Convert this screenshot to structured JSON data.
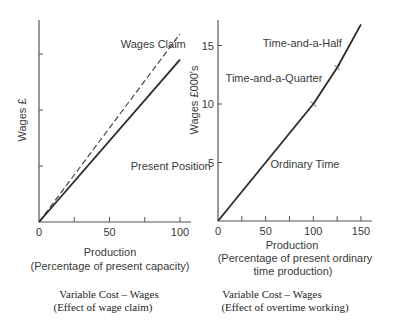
{
  "chart_data": [
    {
      "type": "line",
      "id": "left",
      "xlabel": "Production",
      "xlabel_sub": "(Percentage of present capacity)",
      "ylabel": "Wages £",
      "caption": [
        "Variable Cost – Wages",
        "(Effect of wage claim)"
      ],
      "xlim": [
        0,
        108
      ],
      "ylim": [
        0,
        4.3
      ],
      "x_ticks": [
        0,
        25,
        50,
        75,
        100
      ],
      "x_tick_labels": [
        "0",
        "50",
        "100"
      ],
      "x_tick_label_values": [
        0,
        50,
        100
      ],
      "y_ticks": [
        1,
        2,
        3
      ],
      "y_tick_labels": [],
      "grid": false,
      "series": [
        {
          "name": "Wages Claim",
          "style": "dashed",
          "x": [
            0,
            100
          ],
          "y": [
            0,
            3.36
          ]
        },
        {
          "name": "Present Position",
          "style": "solid",
          "x": [
            0,
            100
          ],
          "y": [
            0,
            2.9
          ]
        }
      ],
      "annotations": [
        {
          "text": "Wages Claim",
          "x": 58,
          "y": 3.1
        },
        {
          "text": "Present Position",
          "x": 65,
          "y": 0.92
        }
      ]
    },
    {
      "type": "line",
      "id": "right",
      "xlabel": "Production",
      "xlabel_sub": "(Percentage of present ordinary",
      "xlabel_sub2": "time production)",
      "ylabel": "Wages £000's",
      "caption": [
        "Variable Cost – Wages",
        "(Effect of overtime working)"
      ],
      "xlim": [
        0,
        162
      ],
      "ylim": [
        0,
        17.2
      ],
      "x_ticks": [
        0,
        25,
        50,
        75,
        100,
        125,
        150
      ],
      "x_tick_labels": [
        "0",
        "50",
        "100",
        "150"
      ],
      "x_tick_label_values": [
        0,
        50,
        100,
        150
      ],
      "y_ticks": [
        5,
        10,
        15
      ],
      "y_tick_labels": [
        "5",
        "10",
        "15"
      ],
      "grid": false,
      "series": [
        {
          "name": "Ordinary Time",
          "style": "solid",
          "x": [
            0,
            100
          ],
          "y": [
            0,
            10
          ]
        },
        {
          "name": "Time-and-a-Quarter",
          "style": "solid",
          "x": [
            100,
            125
          ],
          "y": [
            10,
            13.1
          ]
        },
        {
          "name": "Time-and-a-Half",
          "style": "solid",
          "x": [
            125,
            150
          ],
          "y": [
            13.1,
            16.8
          ]
        }
      ],
      "markers": [
        {
          "x": 100,
          "y": 10,
          "symbol": "x"
        },
        {
          "x": 125,
          "y": 13.1,
          "symbol": "x"
        }
      ],
      "annotations": [
        {
          "text": "Ordinary Time",
          "x": 55,
          "y": 4.5
        },
        {
          "text": "Time-and-a-Quarter",
          "x": 8,
          "y": 11.9
        },
        {
          "text": "Time-and-a-Half",
          "x": 47,
          "y": 14.9
        }
      ]
    }
  ]
}
